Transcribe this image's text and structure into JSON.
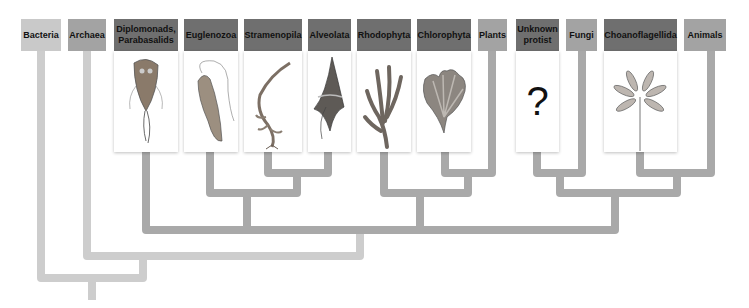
{
  "diagram": {
    "type": "phylogenetic-tree",
    "taxa": [
      {
        "id": "bacteria",
        "label": "Bacteria",
        "shade": "light"
      },
      {
        "id": "archaea",
        "label": "Archaea",
        "shade": "mid"
      },
      {
        "id": "diplomonads",
        "label": "Diplomonads, Parabasalids",
        "shade": "dark",
        "illustration": "giardia-flagellate"
      },
      {
        "id": "euglenozoa",
        "label": "Euglenozoa",
        "shade": "dark",
        "illustration": "euglena-cell"
      },
      {
        "id": "stramenopila",
        "label": "Stramenopila",
        "shade": "dark",
        "illustration": "kelp"
      },
      {
        "id": "alveolata",
        "label": "Alveolata",
        "shade": "dark",
        "illustration": "dinoflagellate"
      },
      {
        "id": "rhodophyta",
        "label": "Rhodophyta",
        "shade": "dark",
        "illustration": "red-alga"
      },
      {
        "id": "chlorophyta",
        "label": "Chlorophyta",
        "shade": "dark",
        "illustration": "green-alga"
      },
      {
        "id": "plants",
        "label": "Plants",
        "shade": "mid"
      },
      {
        "id": "unknown",
        "label": "Unknown protist",
        "shade": "dark",
        "illustration": "question-mark",
        "symbol": "?"
      },
      {
        "id": "fungi",
        "label": "Fungi",
        "shade": "mid"
      },
      {
        "id": "choanoflagellida",
        "label": "Choanoflagellida",
        "shade": "dark",
        "illustration": "choanoflagellate-colony"
      },
      {
        "id": "animals",
        "label": "Animals",
        "shade": "mid"
      }
    ],
    "colors": {
      "light": "#c9c9c9",
      "mid": "#a3a3a3",
      "dark": "#6f6f6f",
      "branch_light": "#cdcdcd",
      "branch_mid": "#a9a9a9"
    }
  }
}
